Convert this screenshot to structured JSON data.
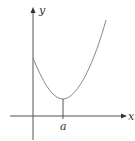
{
  "figure": {
    "type": "function-graph",
    "axes": {
      "x_label": "x",
      "y_label": "y"
    },
    "tick_labels": {
      "a": "a"
    },
    "colors": {
      "axis": "#555555",
      "curve": "#888888",
      "text": "#333333"
    }
  }
}
